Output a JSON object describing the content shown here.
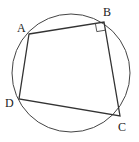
{
  "diagram": {
    "type": "cyclic-quadrilateral",
    "circle": {
      "cx": 71,
      "cy": 73,
      "r": 59
    },
    "vertices": [
      {
        "id": "A",
        "label": "A",
        "x": 29,
        "y": 34,
        "lx": 17,
        "ly": 32
      },
      {
        "id": "B",
        "label": "B",
        "x": 104,
        "y": 22,
        "lx": 104,
        "ly": 17
      },
      {
        "id": "C",
        "label": "C",
        "x": 120,
        "y": 116,
        "lx": 118,
        "ly": 130
      },
      {
        "id": "D",
        "label": "D",
        "x": 19,
        "y": 99,
        "lx": 6,
        "ly": 107
      }
    ],
    "right_angle_at": "B",
    "stroke_color": "#333333"
  }
}
